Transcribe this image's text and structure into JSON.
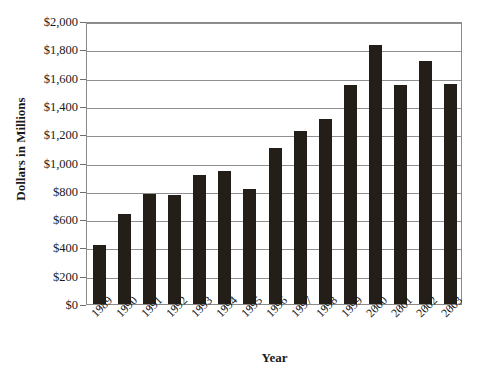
{
  "chart_data": {
    "type": "bar",
    "title": "",
    "xlabel": "Year",
    "ylabel": "Dollars in Millions",
    "categories": [
      "1989",
      "1990",
      "1991",
      "1992",
      "1993",
      "1994",
      "1995",
      "1996",
      "1997",
      "1998",
      "1999",
      "2000",
      "2001",
      "2002",
      "2003"
    ],
    "values": [
      415,
      635,
      780,
      770,
      915,
      940,
      815,
      1100,
      1225,
      1310,
      1550,
      1830,
      1550,
      1720,
      1555
    ],
    "ylim": [
      0,
      2000
    ],
    "ytick_values": [
      0,
      200,
      400,
      600,
      800,
      1000,
      1200,
      1400,
      1600,
      1800,
      2000
    ],
    "ytick_labels": [
      "$0",
      "$200",
      "$400",
      "$600",
      "$800",
      "$1,000",
      "$1,200",
      "$1,400",
      "$1,600",
      "$1,800",
      "$2,000"
    ],
    "grid": true,
    "legend": "none",
    "series": [
      {
        "name": "Dollars in Millions",
        "color": "#231f18",
        "values": [
          415,
          635,
          780,
          770,
          915,
          940,
          815,
          1100,
          1225,
          1310,
          1550,
          1830,
          1550,
          1720,
          1555
        ]
      }
    ]
  },
  "axes": {
    "y_title": "Dollars in Millions",
    "x_title": "Year"
  },
  "colors": {
    "bar": "#231f18",
    "gridline": "#8f8f8f",
    "axis": "#8a8a8a",
    "text": "#1a1a1a"
  }
}
